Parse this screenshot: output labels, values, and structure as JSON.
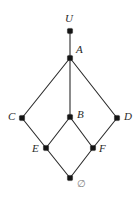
{
  "diagram": {
    "type": "hasse-lattice",
    "background_color": "#ffffff",
    "edge_color": "#2b2b2b",
    "node_color": "#141414",
    "label_color": "#2a2a2a",
    "empty_set_label_color": "#7e7e7e",
    "width": 139,
    "height": 198
  },
  "chart_data": {
    "type": "diagram",
    "nodes": [
      {
        "id": "U",
        "label": "U",
        "x": 70,
        "y": 31,
        "label_x": 65,
        "label_y": 13,
        "label_anchor": "above"
      },
      {
        "id": "A",
        "label": "A",
        "x": 70,
        "y": 58,
        "label_x": 76,
        "label_y": 44,
        "label_anchor": "upper-right"
      },
      {
        "id": "C",
        "label": "C",
        "x": 22,
        "y": 118,
        "label_x": 8,
        "label_y": 111,
        "label_anchor": "left"
      },
      {
        "id": "B",
        "label": "B",
        "x": 70,
        "y": 117,
        "label_x": 77,
        "label_y": 109,
        "label_anchor": "right"
      },
      {
        "id": "D",
        "label": "D",
        "x": 117,
        "y": 118,
        "label_x": 124,
        "label_y": 111,
        "label_anchor": "right"
      },
      {
        "id": "E",
        "label": "E",
        "x": 46,
        "y": 148,
        "label_x": 32,
        "label_y": 143,
        "label_anchor": "left"
      },
      {
        "id": "F",
        "label": "F",
        "x": 93,
        "y": 148,
        "label_x": 99,
        "label_y": 143,
        "label_anchor": "right"
      },
      {
        "id": "O",
        "label": "∅",
        "x": 70,
        "y": 178,
        "label_x": 77,
        "label_y": 178,
        "label_anchor": "lower-right"
      }
    ],
    "edges": [
      {
        "from": "U",
        "to": "A"
      },
      {
        "from": "A",
        "to": "C"
      },
      {
        "from": "A",
        "to": "B"
      },
      {
        "from": "A",
        "to": "D"
      },
      {
        "from": "C",
        "to": "E"
      },
      {
        "from": "B",
        "to": "E"
      },
      {
        "from": "B",
        "to": "F"
      },
      {
        "from": "D",
        "to": "F"
      },
      {
        "from": "E",
        "to": "O"
      },
      {
        "from": "F",
        "to": "O"
      }
    ],
    "node_radius": 2.6,
    "xlabel": "",
    "ylabel": "",
    "grid": false,
    "legend": false
  }
}
